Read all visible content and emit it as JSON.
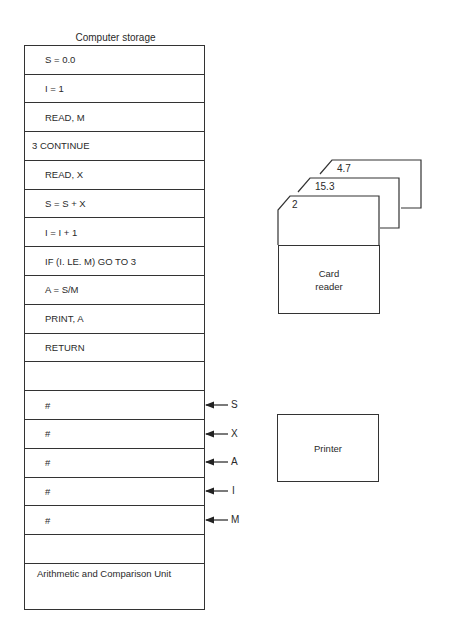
{
  "storage": {
    "title": "Computer storage",
    "instructions": [
      "S = 0.0",
      "I = 1",
      "READ, M",
      "3 CONTINUE",
      "READ, X",
      "S = S + X",
      "I = I + 1",
      "IF (I. LE. M) GO TO 3",
      "A = S/M",
      "PRINT, A",
      "RETURN",
      ""
    ],
    "variables": [
      {
        "value": "#",
        "name": "S"
      },
      {
        "value": "#",
        "name": "X"
      },
      {
        "value": "#",
        "name": "A"
      },
      {
        "value": "#",
        "name": "I"
      },
      {
        "value": "#",
        "name": "M"
      }
    ],
    "empty_after_variables": "",
    "acu_label": "Arithmetic and Comparison Unit"
  },
  "cards": [
    {
      "value": "4.7"
    },
    {
      "value": "15.3"
    },
    {
      "value": "2"
    }
  ],
  "card_reader": {
    "line1": "Card",
    "line2": "reader"
  },
  "printer": {
    "label": "Printer"
  }
}
